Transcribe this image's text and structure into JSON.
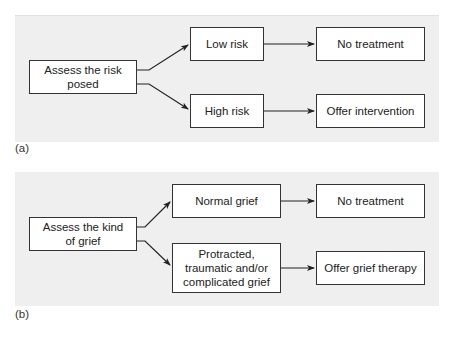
{
  "panel_a": {
    "label": "(a)",
    "start": "Assess the risk posed",
    "branch_top": "Low risk",
    "branch_bottom": "High risk",
    "outcome_top": "No treatment",
    "outcome_bottom": "Offer intervention"
  },
  "panel_b": {
    "label": "(b)",
    "start": "Assess the kind of grief",
    "branch_top": "Normal grief",
    "branch_bottom": "Protracted, traumatic and/or complicated grief",
    "outcome_top": "No treatment",
    "outcome_bottom": "Offer grief therapy"
  },
  "colors": {
    "panel_bg": "#efefef",
    "box_bg": "#ffffff",
    "stroke": "#222222"
  }
}
